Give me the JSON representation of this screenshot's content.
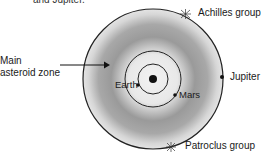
{
  "caption": "and Jupiter.",
  "labels": {
    "main_zone_line1": "Main",
    "main_zone_line2": "asteroid zone",
    "earth": "Earth",
    "mars": "Mars",
    "jupiter": "Jupiter",
    "achilles": "Achilles group",
    "patroclus": "Patroclus group"
  },
  "colors": {
    "ring_dark": "#8a8a8a",
    "ring_light": "#e6e6e6",
    "stroke": "#222222"
  }
}
